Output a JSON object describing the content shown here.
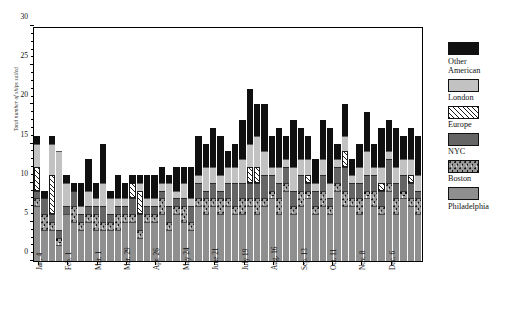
{
  "chart_data": {
    "type": "bar",
    "subtype": "stacked-bar",
    "title": "",
    "xlabel": "",
    "ylabel": "Total number of ships sailed",
    "ylim": [
      0,
      30
    ],
    "ytick_major": [
      0,
      5,
      10,
      15,
      20,
      25,
      30
    ],
    "ytick_step_minor": 1,
    "grid": false,
    "legend_position": "right",
    "categories_stack_order_bottom_to_top": [
      "Philadelphia",
      "Boston",
      "NYC",
      "Europe",
      "London",
      "Other American"
    ],
    "x_tick_labels": [
      "Jan. 4",
      "Feb. 1",
      "Mar. 1",
      "Mar. 29",
      "Apr. 26",
      "May 24",
      "June 21",
      "July 19",
      "Aug. 16",
      "Sep. 13",
      "Oct. 11",
      "Nov. 8",
      "Dec. 6"
    ],
    "x_tick_every_n_bars": 4,
    "n_bars": 53,
    "series": [
      {
        "name": "Philadelphia",
        "color": "#8f8f8f",
        "values": [
          7,
          4,
          4,
          2,
          6,
          5,
          4,
          5,
          4,
          4,
          4,
          4,
          5,
          5,
          3,
          5,
          5,
          6,
          4,
          6,
          5,
          4,
          7,
          6,
          7,
          6,
          7,
          6,
          6,
          7,
          6,
          7,
          8,
          6,
          9,
          6,
          7,
          8,
          6,
          7,
          6,
          9,
          7,
          7,
          6,
          8,
          7,
          6,
          9,
          6,
          8,
          7,
          6
        ]
      },
      {
        "name": "Boston",
        "color": "#9a9a9a",
        "pattern": "dotted",
        "values": [
          1,
          2,
          1,
          1,
          0,
          2,
          1,
          1,
          2,
          1,
          1,
          2,
          1,
          1,
          1,
          1,
          1,
          2,
          1,
          1,
          2,
          1,
          1,
          2,
          1,
          2,
          1,
          1,
          2,
          1,
          2,
          1,
          1,
          2,
          1,
          1,
          2,
          1,
          1,
          2,
          1,
          1,
          2,
          1,
          2,
          1,
          2,
          1,
          1,
          2,
          1,
          1,
          2
        ]
      },
      {
        "name": "NYC",
        "color": "#656565",
        "values": [
          1,
          2,
          1,
          1,
          1,
          2,
          1,
          1,
          1,
          2,
          1,
          1,
          1,
          2,
          2,
          1,
          1,
          1,
          2,
          1,
          1,
          2,
          2,
          1,
          2,
          1,
          2,
          3,
          2,
          2,
          2,
          3,
          2,
          2,
          2,
          2,
          2,
          1,
          2,
          2,
          1,
          2,
          3,
          2,
          2,
          2,
          2,
          2,
          3,
          2,
          2,
          2,
          1
        ]
      },
      {
        "name": "Europe",
        "color": "#ffffff",
        "pattern": "hatched",
        "values": [
          3,
          0,
          5,
          0,
          0,
          0,
          0,
          0,
          0,
          0,
          0,
          0,
          0,
          2,
          3,
          0,
          0,
          0,
          0,
          0,
          0,
          0,
          0,
          0,
          0,
          0,
          0,
          0,
          0,
          2,
          2,
          0,
          0,
          0,
          0,
          0,
          0,
          1,
          0,
          0,
          0,
          0,
          2,
          0,
          0,
          0,
          0,
          1,
          0,
          0,
          0,
          1,
          0
        ]
      },
      {
        "name": "London",
        "color": "#c2c2c2",
        "values": [
          3,
          0,
          4,
          10,
          3,
          0,
          1,
          2,
          1,
          3,
          2,
          1,
          1,
          0,
          1,
          1,
          1,
          1,
          3,
          1,
          2,
          1,
          1,
          3,
          2,
          2,
          2,
          2,
          3,
          3,
          4,
          3,
          1,
          2,
          1,
          3,
          2,
          2,
          1,
          2,
          2,
          1,
          2,
          1,
          2,
          3,
          1,
          2,
          1,
          2,
          2,
          2,
          2
        ]
      },
      {
        "name": "Other American",
        "color": "#101010",
        "values": [
          1,
          1,
          1,
          0,
          1,
          1,
          3,
          4,
          2,
          5,
          1,
          3,
          2,
          1,
          1,
          3,
          3,
          2,
          1,
          3,
          2,
          4,
          5,
          3,
          5,
          5,
          2,
          3,
          5,
          7,
          4,
          6,
          4,
          5,
          3,
          6,
          4,
          3,
          3,
          5,
          7,
          2,
          4,
          2,
          3,
          5,
          3,
          5,
          4,
          5,
          3,
          4,
          5
        ]
      }
    ]
  },
  "legend": {
    "items": [
      {
        "label_line1": "Other",
        "label_line2": "American",
        "swatch": "solid-black"
      },
      {
        "label_line1": "London",
        "label_line2": "",
        "swatch": "light-gray"
      },
      {
        "label_line1": "Europe",
        "label_line2": "",
        "swatch": "hatched"
      },
      {
        "label_line1": "NYC",
        "label_line2": "",
        "swatch": "dark-gray"
      },
      {
        "label_line1": "Boston",
        "label_line2": "",
        "swatch": "dotted"
      },
      {
        "label_line1": "Philadelphia",
        "label_line2": "",
        "swatch": "mid-gray"
      }
    ]
  },
  "caption": "",
  "axis": {
    "y_title": "Total number of ships sailed"
  }
}
